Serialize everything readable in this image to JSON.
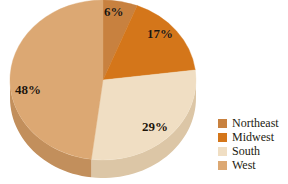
{
  "chart_data": {
    "type": "pie",
    "title": "",
    "subtitle": "",
    "xlabel": "",
    "ylabel": "",
    "grid": false,
    "legend_position": "right",
    "start_angle_deg": 0,
    "direction": "clockwise",
    "three_d": true,
    "categories": [
      "Northeast",
      "Midwest",
      "South",
      "West"
    ],
    "values": [
      6,
      17,
      29,
      48
    ],
    "value_unit": "%",
    "data_labels": [
      "6%",
      "17%",
      "29%",
      "48%"
    ],
    "colors": [
      "#c8813f",
      "#d4761a",
      "#f0dec3",
      "#dca873"
    ],
    "side_colors": [
      "#b06f32",
      "#b96315",
      "#dcc6a6",
      "#c28f5c"
    ],
    "slices": [
      {
        "label": "Northeast",
        "value": 6,
        "data_label": "6%",
        "color": "#c8813f",
        "side_color": "#b06f32"
      },
      {
        "label": "Midwest",
        "value": 17,
        "data_label": "17%",
        "color": "#d4761a",
        "side_color": "#b96315"
      },
      {
        "label": "South",
        "value": 29,
        "data_label": "29%",
        "color": "#f0dec3",
        "side_color": "#dcc6a6"
      },
      {
        "label": "West",
        "value": 48,
        "data_label": "48%",
        "color": "#dca873",
        "side_color": "#c28f5c"
      }
    ]
  },
  "legend": {
    "items": [
      {
        "label": "Northeast",
        "color": "#c8813f"
      },
      {
        "label": "Midwest",
        "color": "#d4761a"
      },
      {
        "label": "South",
        "color": "#f0dec3"
      },
      {
        "label": "West",
        "color": "#dca873"
      }
    ]
  },
  "labels": {
    "slice_0": "6%",
    "slice_1": "17%",
    "slice_2": "29%",
    "slice_3": "48%"
  }
}
